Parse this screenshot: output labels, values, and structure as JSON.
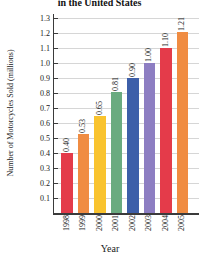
{
  "chart_data": {
    "type": "bar",
    "title": "in the United States",
    "xlabel": "Year",
    "ylabel": "Number of Motorcycles Sold (millions)",
    "categories": [
      "1998",
      "1999",
      "2000",
      "2001",
      "2002",
      "2003",
      "2004",
      "2005"
    ],
    "values": [
      0.4,
      0.53,
      0.65,
      0.81,
      0.9,
      1.0,
      1.1,
      1.21
    ],
    "value_labels": [
      "0.40",
      "0.53",
      "0.65",
      "0.81",
      "0.90",
      "1.00",
      "1.10",
      "1.21"
    ],
    "bar_colors": [
      "#e43b4a",
      "#f08c42",
      "#f9c32e",
      "#6aab80",
      "#3d5fa9",
      "#8d7ec2",
      "#e43b4a",
      "#f08c42"
    ],
    "ylim": [
      0,
      1.3
    ],
    "ytick_labels": [
      "0.1",
      "0.2",
      "0.3",
      "0.4",
      "0.5",
      "0.6",
      "0.7",
      "0.8",
      "0.9",
      "1.0",
      "1.1",
      "1.2",
      "1.3"
    ],
    "grid": "horizontal",
    "legend": "none",
    "colors": {
      "axis": "#3b3b3b",
      "grid": "#d6d6d6",
      "text": "#1a1a1a"
    }
  }
}
